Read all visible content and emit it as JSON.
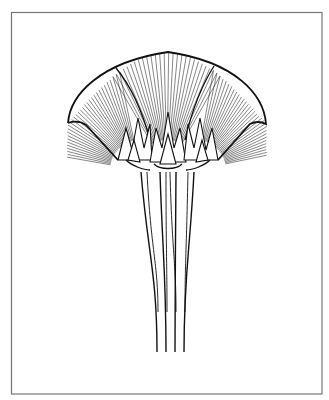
{
  "figure": {
    "background": "#ffffff",
    "ink": "#1a1a1a",
    "frame": {
      "x": 11,
      "y": 12,
      "width": 311,
      "height": 382,
      "color": "#777777"
    },
    "canopy": {
      "left_tip": [
        68,
        123
      ],
      "right_tip": [
        266,
        124
      ],
      "apex": [
        168,
        52
      ],
      "fans": [
        {
          "cx": 140,
          "cy": 170,
          "from_deg": 190,
          "to_deg": 260
        },
        {
          "cx": 167,
          "cy": 170,
          "from_deg": 240,
          "to_deg": 300
        },
        {
          "cx": 196,
          "cy": 170,
          "from_deg": 280,
          "to_deg": 350
        }
      ]
    },
    "stems": {
      "top_y": 172,
      "bottom_y": 352,
      "top_x": [
        141,
        160,
        176,
        194
      ],
      "bottom_x": [
        157,
        166,
        175,
        184
      ]
    }
  }
}
